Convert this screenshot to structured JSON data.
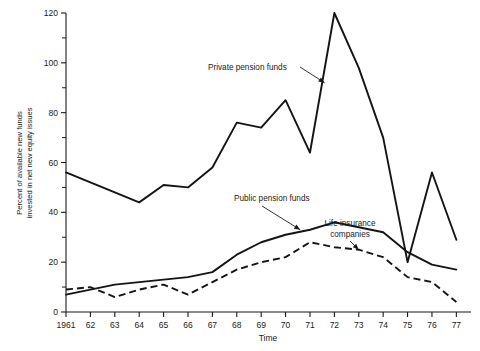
{
  "chart_data": {
    "type": "line",
    "title": "",
    "xlabel": "Time",
    "ylabel": "Percent of available new funds invested in net new equity issues",
    "ylabel_line1": "Percent of available new funds",
    "ylabel_line2": "invested in net new equity issues",
    "x": [
      1961,
      1962,
      1963,
      1964,
      1965,
      1966,
      1967,
      1968,
      1969,
      1970,
      1971,
      1972,
      1973,
      1974,
      1975,
      1976,
      1977
    ],
    "xtick_labels": [
      "1961",
      "62",
      "63",
      "64",
      "65",
      "66",
      "67",
      "68",
      "69",
      "70",
      "71",
      "72",
      "73",
      "74",
      "75",
      "76",
      "77"
    ],
    "ytick_labels": [
      "0",
      "20",
      "40",
      "60",
      "80",
      "100",
      "120"
    ],
    "ytick_values": [
      0,
      20,
      40,
      60,
      80,
      100,
      120
    ],
    "yminor_values": [
      10,
      30,
      50,
      70,
      90,
      110
    ],
    "ylim": [
      0,
      120
    ],
    "xlim": [
      1961,
      1977.6
    ],
    "grid": false,
    "legend_position": "inline-annotations",
    "series": [
      {
        "name": "Private pension funds",
        "style": "solid",
        "values": [
          56,
          52,
          48,
          44,
          51,
          50,
          58,
          76,
          74,
          85,
          64,
          120,
          98,
          70,
          20,
          56,
          29
        ]
      },
      {
        "name": "Public pension funds",
        "style": "solid",
        "values": [
          7,
          9,
          11,
          12,
          13,
          14,
          16,
          23,
          28,
          31,
          33,
          36,
          34,
          32,
          24,
          19,
          17
        ]
      },
      {
        "name": "Life insurance companies",
        "style": "dashed",
        "values": [
          9,
          10,
          6,
          9,
          11,
          7,
          12,
          17,
          20,
          22,
          28,
          26,
          25,
          22,
          14,
          12,
          4
        ]
      }
    ],
    "annotations": [
      {
        "text": "Private pension funds",
        "target_x": 1971.6,
        "target_y": 92
      },
      {
        "text": "Public pension funds",
        "target_x": 1970.6,
        "target_y": 33
      },
      {
        "text": "Life insurance companies",
        "line1": "Life insurance",
        "line2": "companies",
        "target_x": 1973,
        "target_y": 25
      }
    ]
  }
}
